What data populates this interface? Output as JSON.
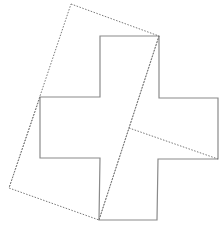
{
  "diagram": {
    "cross_points": "100,36 159,36 159,98 218,98 218,159 158,159 157,220 99,220 100,158 40,158 40,97 100,97",
    "square_points": "71,4 159,36 99,220 9,188",
    "cut_lines": [
      {
        "x1": 159,
        "y1": 36,
        "x2": 99,
        "y2": 220
      },
      {
        "x1": 129,
        "y1": 128,
        "x2": 218,
        "y2": 159
      },
      {
        "x1": 40,
        "y1": 97,
        "x2": 9,
        "y2": 188
      }
    ],
    "colors": {
      "cross_stroke": "#8a8a8a",
      "dotted_stroke": "#777777",
      "background": "#ffffff"
    }
  }
}
